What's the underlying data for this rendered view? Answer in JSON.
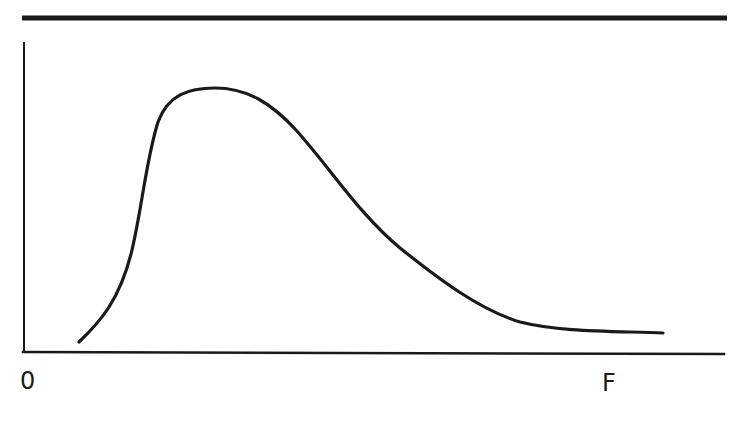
{
  "chart_data": {
    "type": "line",
    "title": "",
    "subtitle": "",
    "xlabel": "",
    "ylabel": "",
    "x_tick_labels": [
      {
        "label": "0",
        "position": "origin"
      },
      {
        "label": "F",
        "position": "near right end of x-axis"
      }
    ],
    "y_tick_labels": [],
    "grid": false,
    "legend": null,
    "axis_ranges_readable": false,
    "series": [
      {
        "name": "curve",
        "points_are": "approximate pixel coordinates traced from the image (x right, y down, origin top-left of 740x421 canvas); NOT data values — the chart has no numeric scale",
        "pixel_trace": [
          [
            79,
            342
          ],
          [
            110,
            300
          ],
          [
            130,
            250
          ],
          [
            142,
            200
          ],
          [
            150,
            160
          ],
          [
            160,
            118
          ],
          [
            178,
            96
          ],
          [
            215,
            88
          ],
          [
            250,
            94
          ],
          [
            280,
            113
          ],
          [
            315,
            160
          ],
          [
            350,
            205
          ],
          [
            380,
            240
          ],
          [
            430,
            275
          ],
          [
            475,
            305
          ],
          [
            510,
            320
          ],
          [
            560,
            329
          ],
          [
            620,
            332
          ],
          [
            663,
            333
          ]
        ]
      }
    ],
    "colors": {
      "line": "#1a1a1a",
      "axes": "#1a1a1a",
      "background": "#ffffff"
    }
  },
  "figure": {
    "top_rule": {
      "x1": 22,
      "y1": 18,
      "x2": 727,
      "y2": 18,
      "stroke_width": 5
    },
    "y_axis": {
      "x1": 24,
      "y1": 43,
      "x2": 24,
      "y2": 351,
      "stroke_width": 2
    },
    "x_axis": {
      "x1": 23,
      "y1": 352,
      "x2": 724,
      "y2": 354,
      "stroke_width": 2.5
    },
    "curve_path": "M 79 342 C 100 322, 120 300, 132 250 C 142 208, 146 160, 158 122 C 168 95, 188 88, 215 88 C 248 88, 272 104, 296 130 C 330 168, 360 215, 400 248 C 440 280, 480 310, 520 322 C 560 332, 610 331, 663 333",
    "labels": {
      "origin": "0",
      "x_end": "F"
    }
  }
}
